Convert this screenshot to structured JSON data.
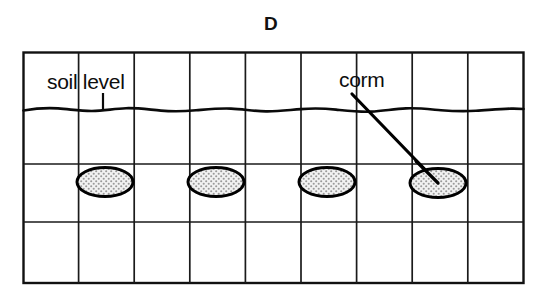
{
  "figure": {
    "panel_letter": "D",
    "labels": {
      "soil_level": "soil level",
      "corm": "corm"
    },
    "colors": {
      "ink": "#000000",
      "grid_line": "#1a1a1a",
      "corm_fill": "#e8e8e8",
      "corm_stipple": "#8f8f8f",
      "background": "#ffffff"
    },
    "grid": {
      "left": 23,
      "right": 524,
      "top": 52,
      "bottom": 283,
      "column_count": 9,
      "column_x": [
        23,
        78.6,
        134.2,
        189.8,
        245.4,
        301,
        356.6,
        412.2,
        467.8,
        523.4
      ],
      "row_y": [
        52,
        109,
        164,
        222,
        283
      ],
      "row_count": 4
    },
    "soil_line": {
      "y": 110,
      "style": "wavy",
      "tick_x": 103,
      "tick_top": 93,
      "tick_bottom": 110
    },
    "corms": [
      {
        "cx": 105,
        "cy": 182,
        "rx": 28,
        "ry": 14.5
      },
      {
        "cx": 216,
        "cy": 182,
        "rx": 28,
        "ry": 14.5
      },
      {
        "cx": 327,
        "cy": 182,
        "rx": 28,
        "ry": 14.5
      },
      {
        "cx": 438,
        "cy": 183,
        "rx": 28,
        "ry": 14.5
      }
    ],
    "leader_line": {
      "x1": 352,
      "y1": 94,
      "x2": 438,
      "y2": 183
    }
  }
}
